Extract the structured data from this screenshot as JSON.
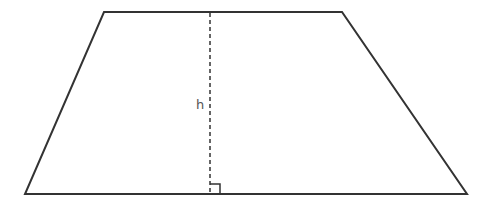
{
  "diagram": {
    "shape": "trapezoid",
    "height_label": "h",
    "right_angle_marker": true,
    "height_line_style": "dashed",
    "colors": {
      "outline": "#333333",
      "height_line": "#333333",
      "label": "#555555",
      "background": "#ffffff"
    }
  }
}
